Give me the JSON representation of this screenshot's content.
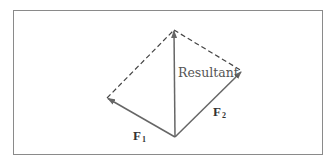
{
  "diagram": {
    "type": "vector-parallelogram",
    "labels": {
      "resultant": "Resultant",
      "f1_main": "F",
      "f1_sub": "1",
      "f2_main": "F",
      "f2_sub": "2"
    },
    "points": {
      "origin": [
        175,
        137
      ],
      "f1_tip": [
        107,
        98
      ],
      "f2_tip": [
        242,
        71
      ],
      "resultant_tip": [
        174,
        30
      ]
    },
    "colors": {
      "frame": "#8a8a8a",
      "solid_vector": "#666666",
      "dashed_line": "#444444",
      "text": "#555555"
    }
  }
}
